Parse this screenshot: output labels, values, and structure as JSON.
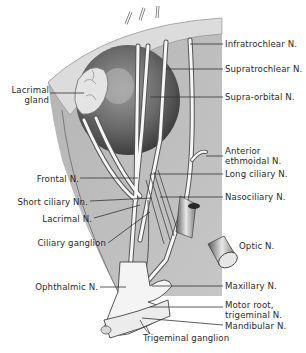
{
  "figure": {
    "colors": {
      "background": "#ffffff",
      "orbit_fill": "#bdbdbd",
      "rim": "#d9d9d9",
      "nerve": "#f7f7f7",
      "leader": "#333333",
      "text": "#2a2a2a"
    }
  },
  "labels": {
    "right": [
      {
        "text": "Infratrochlear N."
      },
      {
        "text": "Supratrochlear N."
      },
      {
        "text": "Supra-orbital N."
      },
      {
        "line1": "Anterior",
        "line2": "ethmoidal N."
      },
      {
        "text": "Long ciliary N."
      },
      {
        "text": "Nasociliary N."
      },
      {
        "text": "Optic N."
      },
      {
        "text": "Maxillary N."
      },
      {
        "line1": "Motor root,",
        "line2": "trigeminal N."
      },
      {
        "text": "Mandibular N."
      }
    ],
    "left": [
      {
        "line1": "Lacrimal",
        "line2": "gland"
      },
      {
        "text": "Frontal N."
      },
      {
        "text": "Short ciliary Nn."
      },
      {
        "text": "Lacrimal N."
      },
      {
        "text": "Ciliary ganglion"
      },
      {
        "text": "Ophthalmic N."
      }
    ],
    "bottom": [
      {
        "text": "Trigeminal ganglion"
      }
    ]
  }
}
